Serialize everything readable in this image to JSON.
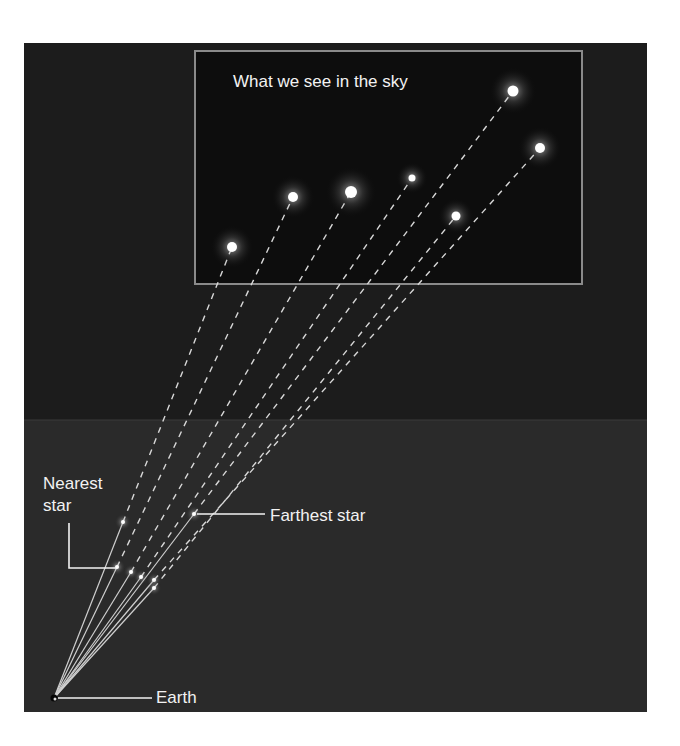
{
  "diagram": {
    "colors": {
      "background": "#ffffff",
      "space_upper": "#1c1c1c",
      "space_lower": "#2a2a2a",
      "inset_bg": "#0d0d0d",
      "inset_border": "#8a8a8a",
      "text": "#f2f2f2",
      "sightline": "#d8d8d8",
      "star": "#ffffff"
    },
    "inset": {
      "title": "What we see in the sky",
      "box": {
        "x": 194,
        "y": 50,
        "w": 389,
        "h": 235
      }
    },
    "labels": {
      "nearest_star": "Nearest\nstar",
      "farthest_star": "Farthest star",
      "earth": "Earth"
    },
    "earth_position": {
      "x": 54,
      "y": 698
    },
    "sky_stars": [
      {
        "x": 232,
        "y": 247,
        "r": 5
      },
      {
        "x": 293,
        "y": 197,
        "r": 5
      },
      {
        "x": 351,
        "y": 192,
        "r": 6
      },
      {
        "x": 412,
        "y": 178,
        "r": 3.5
      },
      {
        "x": 456,
        "y": 216,
        "r": 4.5
      },
      {
        "x": 513,
        "y": 91,
        "r": 5.5
      },
      {
        "x": 540,
        "y": 148,
        "r": 5
      }
    ],
    "space_stars": [
      {
        "x": 117,
        "y": 567,
        "nearest": true
      },
      {
        "x": 123,
        "y": 522
      },
      {
        "x": 131,
        "y": 572
      },
      {
        "x": 141,
        "y": 577
      },
      {
        "x": 154,
        "y": 580
      },
      {
        "x": 154,
        "y": 588
      },
      {
        "x": 194,
        "y": 514,
        "farthest": true
      }
    ]
  }
}
